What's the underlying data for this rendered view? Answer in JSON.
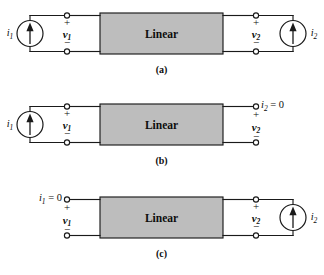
{
  "figure": {
    "type": "circuit-diagram",
    "background_color": "#ffffff",
    "line_color": "#1a1a1a",
    "box_fill_color": "#bdbdbd"
  },
  "common": {
    "box_label": "Linear",
    "plus_sign": "+",
    "minus_sign": "−",
    "equals_zero": "= 0"
  },
  "circuits": [
    {
      "id": "a",
      "caption": "(a)",
      "box_label": "Linear",
      "left": {
        "source": true,
        "current_label": "i",
        "current_sub": "1",
        "voltage_label": "v",
        "voltage_sub": "1",
        "plus": "+",
        "minus": "−"
      },
      "right": {
        "source": true,
        "current_label": "i",
        "current_sub": "2",
        "voltage_label": "v",
        "voltage_sub": "2",
        "plus": "+",
        "minus": "−"
      }
    },
    {
      "id": "b",
      "caption": "(b)",
      "box_label": "Linear",
      "left": {
        "source": true,
        "current_label": "i",
        "current_sub": "1",
        "voltage_label": "v",
        "voltage_sub": "1",
        "plus": "+",
        "minus": "−"
      },
      "right": {
        "source": false,
        "current_label": "i",
        "current_sub": "2",
        "current_value": "= 0",
        "voltage_label": "v",
        "voltage_sub": "2",
        "plus": "+",
        "minus": "−"
      }
    },
    {
      "id": "c",
      "caption": "(c)",
      "box_label": "Linear",
      "left": {
        "source": false,
        "current_label": "i",
        "current_sub": "1",
        "current_value": "= 0",
        "voltage_label": "v",
        "voltage_sub": "1",
        "plus": "+",
        "minus": "−"
      },
      "right": {
        "source": true,
        "current_label": "i",
        "current_sub": "2",
        "voltage_label": "v",
        "voltage_sub": "2",
        "plus": "+",
        "minus": "−"
      }
    }
  ]
}
